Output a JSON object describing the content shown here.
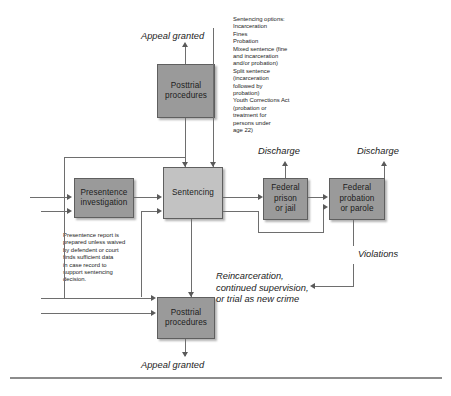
{
  "diagram": {
    "palette": {
      "box_dark": "#9a9a9a",
      "box_light": "#c2c2c2",
      "line": "#6e6e6e",
      "text": "#1c1c1c",
      "background": "#ffffff"
    },
    "nodes": {
      "posttrial_top": "Posttrial\nprocedures",
      "presentence": "Presentence\ninvestigation",
      "sentencing": "Sentencing",
      "federal_prison": "Federal\nprison\nor jail",
      "federal_probation": "Federal\nprobation\nor parole",
      "posttrial_bottom": "Posttrial\nprocedures"
    },
    "labels": {
      "appeal_granted_top": "Appeal granted",
      "appeal_granted_bottom": "Appeal granted",
      "discharge_prison": "Discharge",
      "discharge_probation": "Discharge",
      "violations": "Violations",
      "reincarceration": "Reincarceration,\ncontinued supervision,\nor trial as new crime"
    },
    "annotations": {
      "sentencing_options": "Sentencing options:\nIncarceration\nFines\nProbation\nMixed sentence (fine\n    and incarceration\n    and/or probation)\nSplit sentence\n    (incarceration\n    followed by\n    probation)\nYouth Corrections Act\n    (probation or\n    treatment for\n    persons under\n    age 22)",
      "presentence_note": "Presentence report is\nprepared unless waived\nby defendent or court\nfinds sufficient data\nin case record to\nsupport sentencing\ndecision."
    }
  }
}
